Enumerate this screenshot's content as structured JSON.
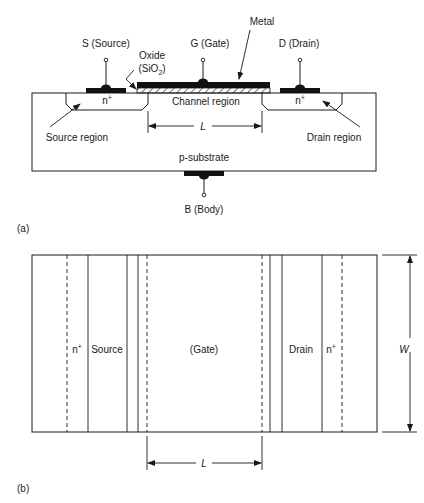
{
  "figure": {
    "panel_a": {
      "label": "(a)",
      "terminals": {
        "source": "S (Source)",
        "gate": "G (Gate)",
        "drain": "D (Drain)",
        "body": "B (Body)"
      },
      "callouts": {
        "metal": "Metal",
        "oxide_line1": "Oxide",
        "oxide_line2_prefix": "(SiO",
        "oxide_line2_sub": "2",
        "oxide_line2_suffix": ")"
      },
      "regions": {
        "source_doping": "n",
        "drain_doping": "n",
        "doping_sup": "+",
        "channel": "Channel region",
        "source_region": "Source region",
        "drain_region": "Drain region",
        "substrate": "p-substrate"
      },
      "dimension_length": "L"
    },
    "panel_b": {
      "label": "(b)",
      "regions": {
        "source_doping": "n",
        "drain_doping": "n",
        "doping_sup": "+",
        "source": "Source",
        "gate": "(Gate)",
        "drain": "Drain"
      },
      "dimension_length": "L",
      "dimension_width": "W"
    },
    "colors": {
      "line": "#1a1a1a",
      "metal": "#111111",
      "background": "#ffffff"
    }
  }
}
